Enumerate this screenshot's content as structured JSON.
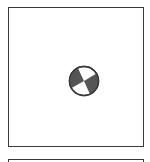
{
  "panels": [
    {
      "id": "main",
      "content": {
        "icon": "beachball-icon",
        "quadrant_colors": {
          "dark": "#555555",
          "light": "#ffffff",
          "outline": "#3a3a3a"
        }
      }
    },
    {
      "id": "next",
      "content": null
    }
  ]
}
